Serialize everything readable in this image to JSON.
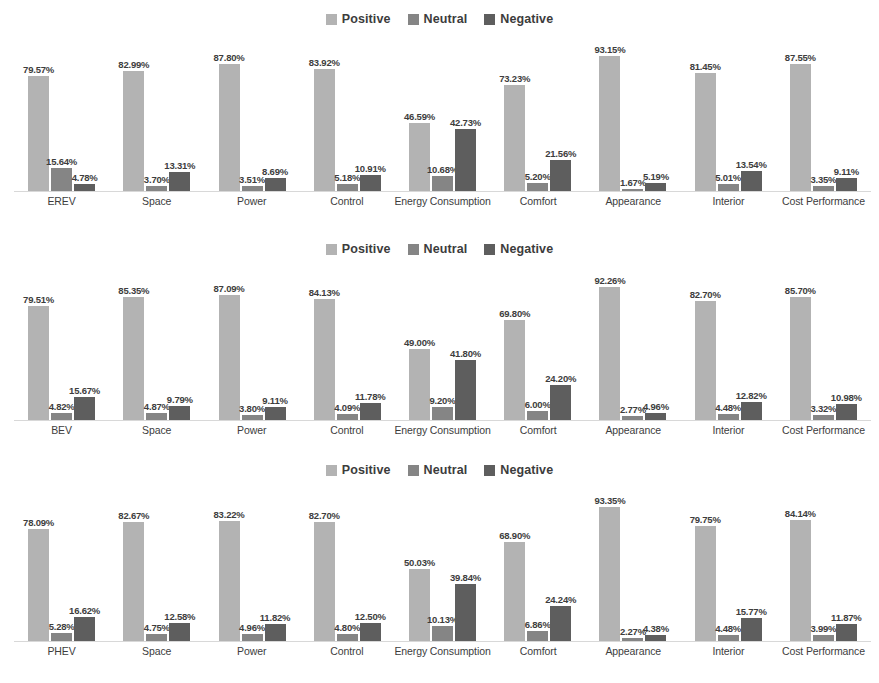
{
  "legend": {
    "items": [
      {
        "label": "Positive",
        "color": "#b3b3b3"
      },
      {
        "label": "Neutral",
        "color": "#858585"
      },
      {
        "label": "Negative",
        "color": "#5e5e5e"
      }
    ]
  },
  "colors": {
    "positive": "#b3b3b3",
    "neutral": "#858585",
    "negative": "#5e5e5e",
    "text": "#3d3d3d",
    "baseline": "#d8d8d8",
    "background": "#ffffff"
  },
  "chart_data": [
    {
      "type": "bar",
      "title": "",
      "xlabel": "",
      "ylabel": "",
      "ylim": [
        0,
        100
      ],
      "grid": false,
      "legend_position": "top-center",
      "categories": [
        "EREV",
        "Space",
        "Power",
        "Control",
        "Energy Consumption",
        "Comfort",
        "Appearance",
        "Interior",
        "Cost Performance"
      ],
      "series": [
        {
          "name": "Positive",
          "values": [
            79.57,
            82.99,
            87.8,
            83.92,
            46.59,
            73.23,
            93.15,
            81.45,
            87.55
          ],
          "labels": [
            "79.57%",
            "82.99%",
            "87.80%",
            "83.92%",
            "46.59%",
            "73.23%",
            "93.15%",
            "81.45%",
            "87.55%"
          ]
        },
        {
          "name": "Neutral",
          "values": [
            15.64,
            3.7,
            3.51,
            5.18,
            10.68,
            5.2,
            1.67,
            5.01,
            3.35
          ],
          "labels": [
            "15.64%",
            "3.70%",
            "3.51%",
            "5.18%",
            "10.68%",
            "5.20%",
            "1.67%",
            "5.01%",
            "3.35%"
          ]
        },
        {
          "name": "Negative",
          "values": [
            4.78,
            13.31,
            8.69,
            10.91,
            42.73,
            21.56,
            5.19,
            13.54,
            9.11
          ],
          "labels": [
            "4.78%",
            "13.31%",
            "8.69%",
            "10.91%",
            "42.73%",
            "21.56%",
            "5.19%",
            "13.54%",
            "9.11%"
          ]
        }
      ]
    },
    {
      "type": "bar",
      "title": "",
      "xlabel": "",
      "ylabel": "",
      "ylim": [
        0,
        100
      ],
      "grid": false,
      "legend_position": "top-center",
      "categories": [
        "BEV",
        "Space",
        "Power",
        "Control",
        "Energy Consumption",
        "Comfort",
        "Appearance",
        "Interior",
        "Cost Performance"
      ],
      "series": [
        {
          "name": "Positive",
          "values": [
            79.51,
            85.35,
            87.09,
            84.13,
            49.0,
            69.8,
            92.26,
            82.7,
            85.7
          ],
          "labels": [
            "79.51%",
            "85.35%",
            "87.09%",
            "84.13%",
            "49.00%",
            "69.80%",
            "92.26%",
            "82.70%",
            "85.70%"
          ]
        },
        {
          "name": "Neutral",
          "values": [
            4.82,
            4.87,
            3.8,
            4.09,
            9.2,
            6.0,
            2.77,
            4.48,
            3.32
          ],
          "labels": [
            "4.82%",
            "4.87%",
            "3.80%",
            "4.09%",
            "9.20%",
            "6.00%",
            "2.77%",
            "4.48%",
            "3.32%"
          ]
        },
        {
          "name": "Negative",
          "values": [
            15.67,
            9.79,
            9.11,
            11.78,
            41.8,
            24.2,
            4.96,
            12.82,
            10.98
          ],
          "labels": [
            "15.67%",
            "9.79%",
            "9.11%",
            "11.78%",
            "41.80%",
            "24.20%",
            "4.96%",
            "12.82%",
            "10.98%"
          ]
        }
      ]
    },
    {
      "type": "bar",
      "title": "",
      "xlabel": "",
      "ylabel": "",
      "ylim": [
        0,
        100
      ],
      "grid": false,
      "legend_position": "top-center",
      "categories": [
        "PHEV",
        "Space",
        "Power",
        "Control",
        "Energy Consumption",
        "Comfort",
        "Appearance",
        "Interior",
        "Cost Performance"
      ],
      "series": [
        {
          "name": "Positive",
          "values": [
            78.09,
            82.67,
            83.22,
            82.7,
            50.03,
            68.9,
            93.35,
            79.75,
            84.14
          ],
          "labels": [
            "78.09%",
            "82.67%",
            "83.22%",
            "82.70%",
            "50.03%",
            "68.90%",
            "93.35%",
            "79.75%",
            "84.14%"
          ]
        },
        {
          "name": "Neutral",
          "values": [
            5.28,
            4.75,
            4.96,
            4.8,
            10.13,
            6.86,
            2.27,
            4.48,
            3.99
          ],
          "labels": [
            "5.28%",
            "4.75%",
            "4.96%",
            "4.80%",
            "10.13%",
            "6.86%",
            "2.27%",
            "4.48%",
            "3.99%"
          ]
        },
        {
          "name": "Negative",
          "values": [
            16.62,
            12.58,
            11.82,
            12.5,
            39.84,
            24.24,
            4.38,
            15.77,
            11.87
          ],
          "labels": [
            "16.62%",
            "12.58%",
            "11.82%",
            "12.50%",
            "39.84%",
            "24.24%",
            "4.38%",
            "15.77%",
            "11.87%"
          ]
        }
      ]
    }
  ]
}
